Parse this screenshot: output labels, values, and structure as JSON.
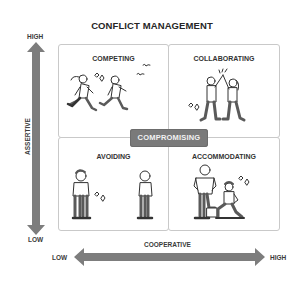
{
  "title": "CONFLICT MANAGEMENT",
  "vertical_axis": {
    "name": "ASSERTIVE",
    "high_label": "HIGH",
    "low_label": "LOW"
  },
  "horizontal_axis": {
    "name": "COOPERATIVE",
    "low_label": "LOW",
    "high_label": "HIGH"
  },
  "quadrants": [
    {
      "label": "COMPETING",
      "position": "top-left",
      "illustration": "two-people-racing-icon"
    },
    {
      "label": "COLLABORATING",
      "position": "top-right",
      "illustration": "two-people-high-five-icon"
    },
    {
      "label": "AVOIDING",
      "position": "bottom-left",
      "illustration": "two-people-turned-away-icon"
    },
    {
      "label": "ACCOMMODATING",
      "position": "bottom-right",
      "illustration": "person-helping-kneeling-person-icon"
    }
  ],
  "center": {
    "label": "COMPROMISING"
  },
  "colors": {
    "arrow": "#7d7d7d",
    "badge": "#7a7a7a",
    "border": "#c9c9c9",
    "text": "#262626"
  }
}
